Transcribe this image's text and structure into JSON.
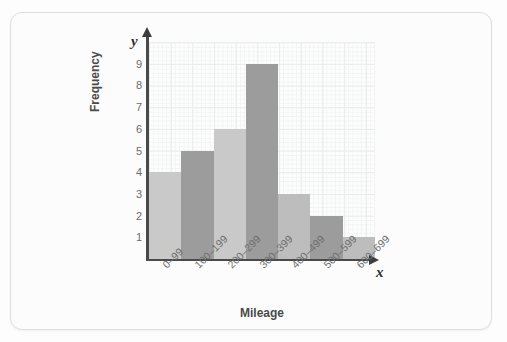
{
  "chart_data": {
    "type": "bar",
    "title": "",
    "xlabel": "Mileage",
    "ylabel": "Frequency",
    "x_axis_variable": "x",
    "y_axis_variable": "y",
    "categories": [
      "0–99",
      "100–199",
      "200–299",
      "300–399",
      "400–499",
      "500–599",
      "600–699"
    ],
    "values": [
      4,
      5,
      6,
      9,
      3,
      2,
      1
    ],
    "ylim": [
      0,
      10
    ],
    "yticks": [
      9,
      8,
      7,
      6,
      5,
      4,
      3,
      2,
      1
    ],
    "grid": true,
    "legend": "none",
    "bar_colors": [
      "#c9c9c9",
      "#9c9c9c",
      "#c9c9c9",
      "#9c9c9c",
      "#bdbdbd",
      "#9c9c9c",
      "#bdbdbd"
    ],
    "colors": {
      "bar_light": "#c9c9c9",
      "bar_dark": "#9c9c9c",
      "axis": "#4a4a4a",
      "grid_minor": "#f2f4f4",
      "grid_major": "#e9ecec",
      "tick_label": "#6a6a6a",
      "axis_title": "#4a4a4a",
      "card_background": "#fcfcfc",
      "card_border": "#dededd"
    }
  }
}
